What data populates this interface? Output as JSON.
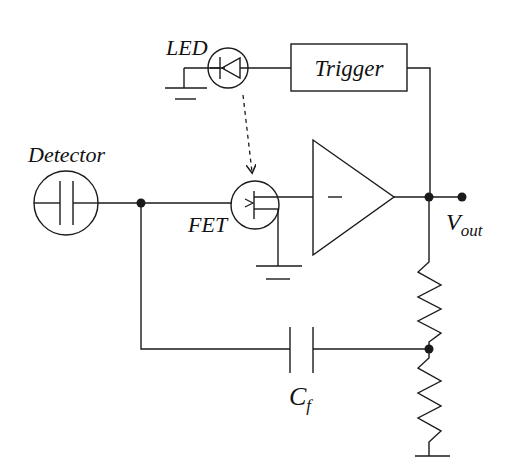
{
  "diagram": {
    "type": "circuit-schematic",
    "labels": {
      "led": "LED",
      "trigger": "Trigger",
      "detector": "Detector",
      "fet": "FET",
      "vout_main": "V",
      "vout_sub": "out",
      "cf_main": "C",
      "cf_sub": "f"
    },
    "components": [
      {
        "id": "detector",
        "kind": "detector (capacitor in circle)"
      },
      {
        "id": "fet",
        "kind": "field-effect transistor"
      },
      {
        "id": "amplifier",
        "kind": "op-amp triangle (inverting input)"
      },
      {
        "id": "led",
        "kind": "light-emitting diode"
      },
      {
        "id": "trigger",
        "kind": "trigger block"
      },
      {
        "id": "cf",
        "kind": "feedback capacitor"
      },
      {
        "id": "r_upper",
        "kind": "resistor"
      },
      {
        "id": "r_lower",
        "kind": "resistor"
      },
      {
        "id": "ground_led",
        "kind": "ground"
      },
      {
        "id": "ground_fet",
        "kind": "ground"
      },
      {
        "id": "ground_divider",
        "kind": "ground"
      }
    ],
    "colors": {
      "ink": "#1a1a1a",
      "background": "#ffffff"
    }
  }
}
